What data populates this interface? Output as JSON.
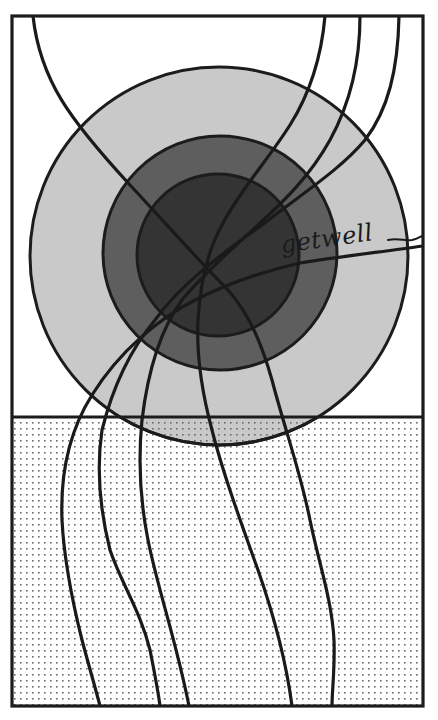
{
  "artwork": {
    "caption": "getwell",
    "colors": {
      "background": "#ffffff",
      "frame_stroke": "#1c1c1c",
      "outer_circle": "#c9c9c9",
      "middle_circle": "#5e5e5e",
      "inner_circle": "#343434",
      "dot_pattern": "#6a6a6a",
      "line_stroke": "#1a1a1a"
    },
    "frame": {
      "x": 12,
      "y": 16,
      "width": 411,
      "height": 690
    },
    "horizon_y": 417,
    "circles": [
      {
        "name": "outer",
        "cx": 219,
        "cy": 256,
        "r": 189
      },
      {
        "name": "middle",
        "cx": 220,
        "cy": 253,
        "r": 117
      },
      {
        "name": "inner",
        "cx": 218,
        "cy": 255,
        "r": 81
      }
    ],
    "line_count": 7
  }
}
